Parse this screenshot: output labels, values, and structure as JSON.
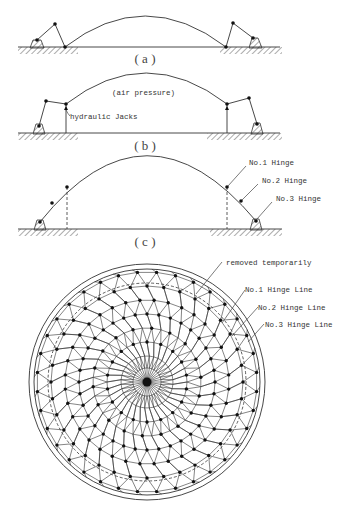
{
  "panels": {
    "a": {
      "caption": "( a )"
    },
    "b": {
      "caption": "( b )",
      "label_air": "(air pressure)",
      "label_jacks": "hydraulic Jacks"
    },
    "c": {
      "caption": "( c )",
      "hinges": [
        "No.1 Hinge",
        "No.2 Hinge",
        "No.3 Hinge"
      ]
    }
  },
  "plan": {
    "labels": [
      "removed temporarily",
      "No.1 Hinge Line",
      "No.2 Hinge Line",
      "No.3 Hinge Line"
    ],
    "center": [
      147,
      382
    ],
    "outer_radius": 118,
    "inner_ring_radius": 113,
    "hinge_line_radius": 99,
    "radial_count": 36
  },
  "colors": {
    "ink": "#333333",
    "background": "#ffffff"
  }
}
